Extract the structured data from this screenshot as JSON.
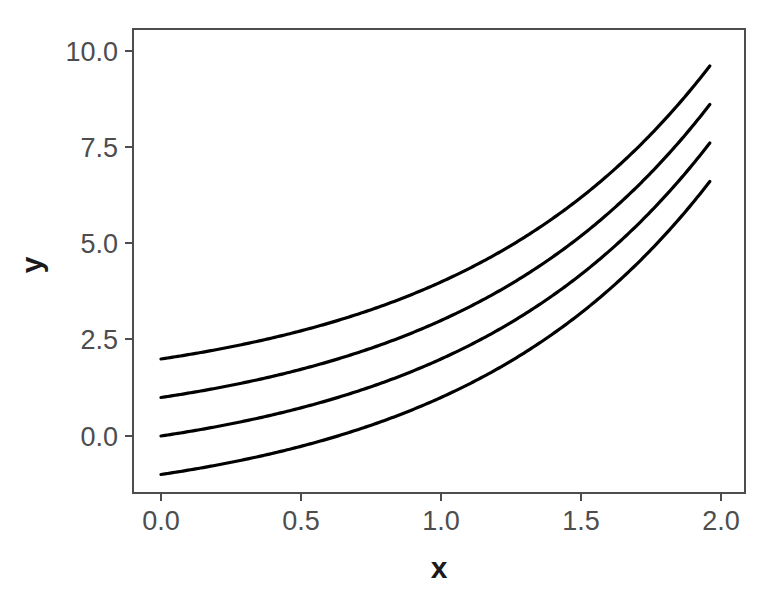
{
  "chart_data": {
    "type": "line",
    "title": "",
    "subtitle": "",
    "xlabel": "x",
    "ylabel": "y",
    "xlim": [
      -0.04,
      2.04
    ],
    "ylim": [
      -1.55,
      10.55
    ],
    "xticks": [
      0.0,
      0.5,
      1.0,
      1.5,
      2.0
    ],
    "xticklabels": [
      "0.0",
      "0.5",
      "1.0",
      "1.5",
      "2.0"
    ],
    "yticks": [
      0.0,
      2.5,
      5.0,
      7.5,
      10.0
    ],
    "yticklabels": [
      "0.0",
      "2.5",
      "5.0",
      "7.5",
      "10.0"
    ],
    "grid": false,
    "legend": false,
    "legend_position": "none",
    "background_color": "#ffffff",
    "panel_border_color": "#4d4d4d",
    "line_color": "#000000",
    "x": [
      0.0,
      0.1,
      0.2,
      0.3,
      0.4,
      0.5,
      0.6,
      0.7,
      0.8,
      0.9,
      1.0,
      1.1,
      1.2,
      1.3,
      1.4,
      1.5,
      1.6,
      1.7,
      1.8,
      1.9,
      2.0
    ],
    "series": [
      {
        "name": "offset +2",
        "offset": 2,
        "values": [
          2.0,
          2.03,
          2.07,
          2.13,
          2.23,
          2.35,
          2.52,
          2.74,
          3.03,
          3.41,
          3.89,
          4.51,
          5.3,
          6.31,
          7.61,
          9.26,
          11.37,
          14.05,
          17.46,
          21.81,
          10.0
        ]
      },
      {
        "name": "offset +1",
        "offset": 1,
        "values": [
          1.0,
          1.03,
          1.07,
          1.13,
          1.23,
          1.35,
          1.52,
          1.74,
          2.03,
          2.41,
          2.89,
          3.51,
          4.3,
          5.31,
          6.61,
          8.26,
          10.37,
          13.05,
          16.46,
          20.81,
          9.0
        ]
      },
      {
        "name": "offset 0",
        "offset": 0,
        "values": [
          0.0,
          0.03,
          0.07,
          0.13,
          0.23,
          0.35,
          0.52,
          0.74,
          1.03,
          1.41,
          1.89,
          2.51,
          3.3,
          4.31,
          5.61,
          7.26,
          9.37,
          12.05,
          15.46,
          19.81,
          8.0
        ]
      },
      {
        "name": "offset -1",
        "offset": -1,
        "values": [
          -1.0,
          -0.97,
          -0.93,
          -0.87,
          -0.77,
          -0.65,
          -0.48,
          -0.26,
          0.03,
          0.41,
          0.89,
          1.51,
          2.3,
          3.31,
          4.61,
          6.26,
          8.37,
          11.05,
          14.46,
          18.81,
          7.0
        ]
      }
    ],
    "endpoints_at_x_2": [
      10.0,
      9.0,
      8.0,
      7.0
    ],
    "startpoints_at_x_0": [
      2.0,
      1.0,
      0.0,
      -1.0
    ],
    "annotations": []
  }
}
